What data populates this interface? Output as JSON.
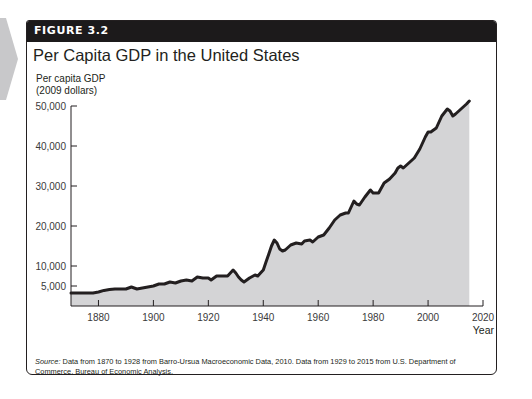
{
  "figure": {
    "label": "FIGURE 3.2",
    "title": "Per Capita GDP in the United States",
    "source_label": "Source:",
    "source_text": " Data from 1870 to 1928 from Barro-Ursua Macroeconomic Data, 2010. Data from 1929 to 2015 from U.S. Department of Commerce, Bureau of Economic Analysis."
  },
  "colors": {
    "header_bg": "#1c1a1b",
    "header_text": "#ffffff",
    "area_fill": "#d4d4d6",
    "line": "#231f20",
    "side_tab": "#c8c8ca"
  },
  "chart_data": {
    "type": "area",
    "title": "Per Capita GDP in the United States",
    "ylabel": "Per capita GDP (2009 dollars)",
    "ylabel_lines": [
      "Per capita GDP",
      "(2009 dollars)"
    ],
    "xlabel": "Year",
    "xlim": [
      1870,
      2020
    ],
    "ylim": [
      0,
      50000
    ],
    "yticks": [
      5000,
      10000,
      20000,
      30000,
      40000,
      50000
    ],
    "ytick_labels": [
      "5,000",
      "10,000",
      "20,000",
      "30,000",
      "40,000",
      "50,000"
    ],
    "xticks": [
      1880,
      1900,
      1920,
      1940,
      1960,
      1980,
      2000,
      2020
    ],
    "xtick_labels": [
      "1880",
      "1900",
      "1920",
      "1940",
      "1960",
      "1980",
      "2000",
      "2020"
    ],
    "grid": false,
    "legend": null,
    "series": [
      {
        "name": "Per capita GDP",
        "x": [
          1870,
          1872,
          1875,
          1878,
          1880,
          1882,
          1884,
          1886,
          1888,
          1890,
          1892,
          1894,
          1896,
          1898,
          1900,
          1902,
          1904,
          1906,
          1908,
          1910,
          1912,
          1914,
          1916,
          1918,
          1920,
          1921,
          1923,
          1925,
          1927,
          1929,
          1930,
          1931,
          1932,
          1933,
          1935,
          1937,
          1938,
          1939,
          1940,
          1941,
          1942,
          1943,
          1944,
          1945,
          1946,
          1947,
          1948,
          1950,
          1952,
          1954,
          1955,
          1957,
          1958,
          1960,
          1962,
          1964,
          1966,
          1968,
          1970,
          1971,
          1973,
          1974,
          1975,
          1977,
          1979,
          1980,
          1982,
          1984,
          1986,
          1988,
          1989,
          1990,
          1991,
          1993,
          1995,
          1997,
          1999,
          2000,
          2001,
          2003,
          2005,
          2007,
          2008,
          2009,
          2010,
          2012,
          2014,
          2015
        ],
        "values": [
          3250,
          3250,
          3250,
          3250,
          3500,
          3900,
          4100,
          4250,
          4250,
          4250,
          4750,
          4250,
          4500,
          4750,
          5000,
          5500,
          5500,
          6000,
          5750,
          6250,
          6500,
          6250,
          7250,
          7000,
          7000,
          6500,
          7500,
          7500,
          7500,
          9000,
          8250,
          7250,
          6500,
          6000,
          7000,
          7750,
          7500,
          8250,
          9000,
          11000,
          13000,
          15000,
          16500,
          15750,
          14250,
          13750,
          14000,
          15250,
          15750,
          15500,
          16250,
          16500,
          16000,
          17250,
          17750,
          19500,
          21500,
          22750,
          23250,
          23250,
          26250,
          25500,
          25250,
          27250,
          29000,
          28250,
          28250,
          30750,
          31750,
          33250,
          34500,
          35000,
          34500,
          35750,
          37000,
          39250,
          42250,
          43500,
          43500,
          44500,
          47500,
          49250,
          48750,
          47500,
          48000,
          49250,
          50500,
          51250
        ]
      }
    ]
  }
}
